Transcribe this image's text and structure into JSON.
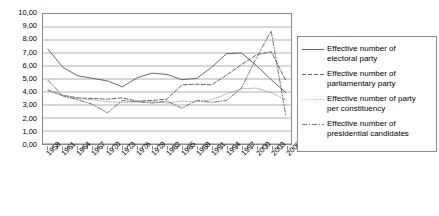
{
  "chart_data": {
    "type": "line",
    "title": "",
    "xlabel": "",
    "ylabel": "",
    "ylim": [
      0,
      10
    ],
    "ytick_step": 1,
    "grid": true,
    "legend_position": "right",
    "decimal_separator": ",",
    "ytick_labels": [
      "10,00",
      "9,00",
      "8,00",
      "7,00",
      "6,00",
      "5,00",
      "4,00",
      "3,00",
      "2,00",
      "1,00",
      "0,00"
    ],
    "ytick_values": [
      10,
      9,
      8,
      7,
      6,
      5,
      4,
      3,
      2,
      1,
      0
    ],
    "xtick_labels": [
      "1958",
      "1961",
      "1964",
      "1967",
      "1970",
      "1973",
      "1976",
      "1979",
      "1982",
      "1985",
      "1988",
      "1991",
      "1994",
      "1997",
      "2000",
      "2003",
      "2006"
    ],
    "x": [
      1958,
      1961,
      1964,
      1967,
      1970,
      1973,
      1976,
      1979,
      1982,
      1985,
      1988,
      1991,
      1994,
      1997,
      2000,
      2003,
      2006
    ],
    "xlim": [
      1957,
      2007
    ],
    "series": [
      {
        "name": "Effective number of electoral party",
        "style": "solid",
        "color": "#555555",
        "values": [
          7.3,
          5.9,
          5.25,
          5.05,
          4.85,
          4.4,
          5.1,
          5.45,
          5.35,
          4.95,
          5.05,
          5.9,
          6.95,
          7.0,
          6.05,
          4.95,
          3.95
        ]
      },
      {
        "name": "Effective number of parliamentary party",
        "style": "dashed",
        "color": "#555555",
        "values": [
          4.15,
          3.75,
          3.55,
          3.5,
          3.45,
          3.55,
          3.3,
          3.35,
          3.45,
          4.55,
          4.6,
          4.55,
          5.3,
          6.1,
          6.85,
          7.1,
          4.85
        ]
      },
      {
        "name": "Effective number of party per constituency",
        "style": "dotted",
        "color": "#9a9a9a",
        "values": [
          4.1,
          3.7,
          3.5,
          3.4,
          3.25,
          3.2,
          3.25,
          3.25,
          3.15,
          3.3,
          3.25,
          3.4,
          3.85,
          4.25,
          4.3,
          3.95,
          3.4
        ]
      },
      {
        "name": "Effective number of presidential candidates",
        "style": "dashdot",
        "color": "#666666",
        "values": [
          4.9,
          3.7,
          3.4,
          3.05,
          2.4,
          3.35,
          3.25,
          3.15,
          3.3,
          2.75,
          3.35,
          3.2,
          3.35,
          4.3,
          6.6,
          8.7,
          2.1
        ]
      }
    ]
  },
  "legend": {
    "items": [
      {
        "label_line1": "Effective number of",
        "label_line2": "electoral party"
      },
      {
        "label_line1": "Effective number of",
        "label_line2": "parliamentary party"
      },
      {
        "label_line1": "Effective number of party",
        "label_line2": "per constituency"
      },
      {
        "label_line1": "Effective number of",
        "label_line2": "presidential candidates"
      }
    ]
  }
}
